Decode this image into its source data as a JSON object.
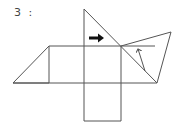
{
  "diagram": {
    "label": "3 :",
    "line_color": "#555555",
    "arrow_color": "#111111",
    "shapes": {
      "left_triangle": [
        [
          13,
          83
        ],
        [
          49,
          46
        ],
        [
          49,
          83
        ]
      ],
      "center_square": [
        [
          49,
          46
        ],
        [
          121,
          46
        ],
        [
          121,
          83
        ],
        [
          49,
          83
        ]
      ],
      "top_triangle": [
        [
          84,
          9
        ],
        [
          84,
          46
        ],
        [
          121,
          46
        ]
      ],
      "bottom_square": [
        [
          84,
          83
        ],
        [
          121,
          83
        ],
        [
          121,
          121
        ],
        [
          84,
          121
        ]
      ],
      "right_triangle_lower": [
        [
          121,
          46
        ],
        [
          157,
          83
        ],
        [
          121,
          83
        ]
      ],
      "right_quad": [
        [
          121,
          46
        ],
        [
          171,
          32
        ],
        [
          157,
          83
        ]
      ]
    },
    "arrows": [
      {
        "name": "bold-right-arrow",
        "from": [
          89,
          38
        ],
        "to": [
          104,
          38
        ]
      },
      {
        "name": "thin-up-arrow",
        "from": [
          145,
          71
        ],
        "to": [
          138,
          48
        ]
      }
    ]
  }
}
